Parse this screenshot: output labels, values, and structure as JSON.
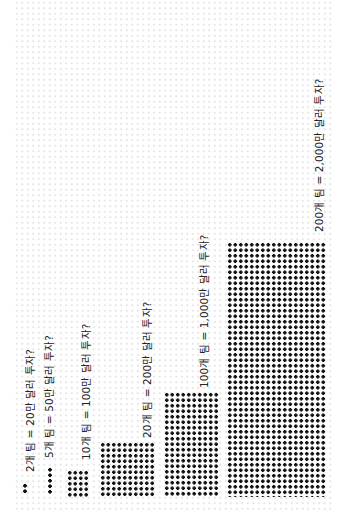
{
  "diagram": {
    "orientation": "rotated-90-ccw",
    "dot_color": "#111111",
    "grid_color": "#e4e4e4",
    "groups": [
      {
        "teams": 2,
        "label": "2개 팀 = 20만 달러 투자?",
        "cols": 1,
        "rows": 2
      },
      {
        "teams": 5,
        "label": "5개 팀 = 50만 달러 투자?",
        "cols": 1,
        "rows": 5
      },
      {
        "teams": 10,
        "label": "10개 팀 = 100만 달러 투자?",
        "cols": 4,
        "rows": 5
      },
      {
        "teams": 20,
        "label": "20개 팀 = 200만 달러 투자?",
        "cols": 10,
        "rows": 10
      },
      {
        "teams": 100,
        "label": "100개 팀 = 1,000만 달러 투자?",
        "cols": 10,
        "rows": 19
      },
      {
        "teams": 200,
        "label": "200개 팀 = 2,000만 달러 투자?",
        "cols": 18,
        "rows": 46
      }
    ]
  }
}
